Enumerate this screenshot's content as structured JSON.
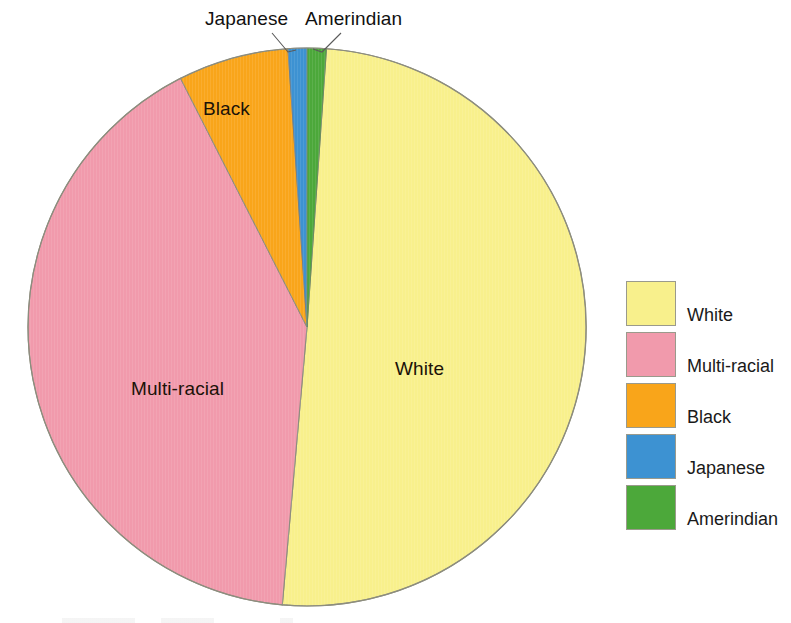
{
  "chart_data": {
    "type": "pie",
    "title": "",
    "categories": [
      "White",
      "Multi-racial",
      "Black",
      "Japanese",
      "Amerindian"
    ],
    "values": [
      50.3,
      41.1,
      6.4,
      1.1,
      1.1
    ],
    "unit": "percent",
    "colors": [
      "#F8F08C",
      "#F19AAC",
      "#F9A51A",
      "#3D92D2",
      "#4CA83A"
    ],
    "start_angle_deg": 4,
    "direction": "clockwise",
    "legend_position": "right",
    "grid": false,
    "labels_inside": [
      "White",
      "Multi-racial",
      "Black"
    ],
    "labels_callout": [
      "Japanese",
      "Amerindian"
    ]
  },
  "pie": {
    "center_x": 307,
    "center_y": 327,
    "radius": 279,
    "slices": [
      {
        "key": "white",
        "label": "White",
        "color": "#F8F08C",
        "value": 50.3
      },
      {
        "key": "multiracial",
        "label": "Multi-racial",
        "color": "#F19AAC",
        "value": 41.1
      },
      {
        "key": "black",
        "label": "Black",
        "color": "#F9A51A",
        "value": 6.4
      },
      {
        "key": "japanese",
        "label": "Japanese",
        "color": "#3D92D2",
        "value": 1.1
      },
      {
        "key": "amerindian",
        "label": "Amerindian",
        "color": "#4CA83A",
        "value": 1.1
      }
    ]
  },
  "callouts": {
    "japanese": "Japanese",
    "amerindian": "Amerindian"
  },
  "slice_labels": {
    "white": "White",
    "black": "Black",
    "multiracial": "Multi-racial"
  },
  "legend": {
    "items": [
      {
        "label": "White",
        "color": "#F8F08C"
      },
      {
        "label": "Multi-racial",
        "color": "#F19AAC"
      },
      {
        "label": "Black",
        "color": "#F9A51A"
      },
      {
        "label": "Japanese",
        "color": "#3D92D2"
      },
      {
        "label": "Amerindian",
        "color": "#4CA83A"
      }
    ]
  }
}
